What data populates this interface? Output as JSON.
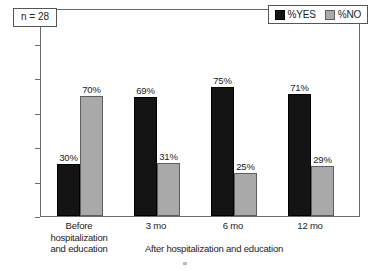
{
  "annotation": {
    "sample_size_label": "n = 28"
  },
  "legend": {
    "position": "top-right",
    "items": [
      {
        "label": "%YES",
        "color": "#141414",
        "swatch": "yes"
      },
      {
        "label": "%NO",
        "color": "#a9a9a9",
        "swatch": "no"
      }
    ]
  },
  "axes": {
    "y_ticks": [
      "0%",
      "20%",
      "40%",
      "60%",
      "80%",
      "100%"
    ],
    "x_caption": "After hospitalization and education",
    "x_groups": [
      {
        "lines": [
          "Before",
          "hospitalization",
          "and education"
        ]
      },
      {
        "lines": [
          "3 mo"
        ]
      },
      {
        "lines": [
          "6 mo"
        ]
      },
      {
        "lines": [
          "12 mo"
        ]
      }
    ]
  },
  "chart_data": {
    "type": "bar",
    "title": "",
    "subtitle": "",
    "xlabel": "After hospitalization and education",
    "ylabel": "",
    "ylim": [
      0,
      100
    ],
    "yticks": [
      0,
      20,
      40,
      60,
      80,
      100
    ],
    "ytick_labels": [
      "0%",
      "20%",
      "40%",
      "60%",
      "80%",
      "100%"
    ],
    "grid": false,
    "legend_position": "top-right",
    "annotations": [
      "n = 28"
    ],
    "categories": [
      "Before hospitalization and education",
      "3 mo",
      "6 mo",
      "12 mo"
    ],
    "series": [
      {
        "name": "%YES",
        "color": "#141414",
        "values": [
          30,
          69,
          75,
          71
        ],
        "value_labels": [
          "30%",
          "69%",
          "75%",
          "71%"
        ]
      },
      {
        "name": "%NO",
        "color": "#a9a9a9",
        "values": [
          70,
          31,
          25,
          29
        ],
        "value_labels": [
          "70%",
          "31%",
          "25%",
          "29%"
        ]
      }
    ]
  }
}
